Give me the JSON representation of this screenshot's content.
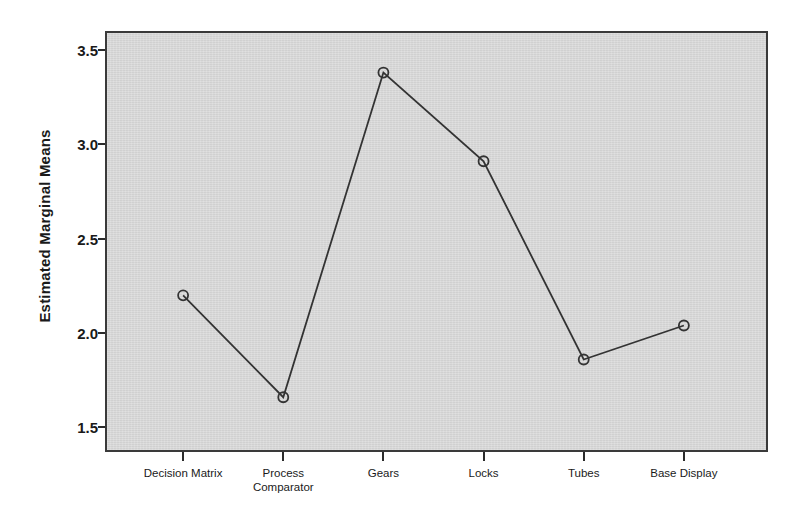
{
  "chart_data": {
    "type": "line",
    "title": "",
    "xlabel": "",
    "ylabel": "Estimated Marginal Means",
    "categories": [
      "Decision Matrix",
      "Process\nComparator",
      "Gears",
      "Locks",
      "Tubes",
      "Base Display"
    ],
    "values": [
      2.2,
      1.66,
      3.38,
      2.91,
      1.86,
      2.04
    ],
    "series": [
      {
        "name": "Estimated Marginal Means",
        "values": [
          2.2,
          1.66,
          3.38,
          2.91,
          1.86,
          2.04
        ]
      }
    ],
    "ylim": [
      1.37,
      3.6
    ],
    "ytick_values": [
      1.5,
      2.0,
      2.5,
      3.0,
      3.5
    ],
    "ytick_labels": [
      "1.5",
      "2.0",
      "2.5",
      "3.0",
      "3.5"
    ],
    "grid": false,
    "legend": false,
    "legend_position": "none",
    "marker": "open-circle",
    "line_color": "#333333",
    "marker_color": "#333333",
    "plot_background_color": "#d6d6d6",
    "figure_background_color": "#ffffff",
    "axis_color": "#3a3a3a"
  },
  "axis": {
    "y_title": "Estimated Marginal Means"
  }
}
